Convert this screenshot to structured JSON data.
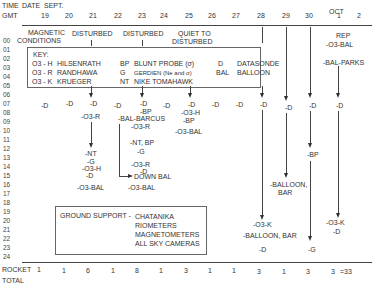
{
  "header": {
    "time_label": "TIME",
    "date_label": "DATE",
    "month_sept": "SEPT.",
    "gmt_label": "GMT",
    "month_oct": "OCT",
    "dates": [
      "19",
      "20",
      "21",
      "22",
      "23",
      "24",
      "25",
      "26",
      "27",
      "28",
      "29",
      "30",
      "1",
      "2"
    ]
  },
  "magnetic": {
    "label_line1": "MAGNETIC",
    "label_line2": "CONDITIONS",
    "disturbed1": "DISTURBED",
    "disturbed2": "DISTURBED",
    "quiet_line1": "QUIET TO",
    "quiet_line2": "DISTURBED"
  },
  "hours": [
    "00",
    "01",
    "02",
    "03",
    "04",
    "05",
    "06",
    "07",
    "08",
    "09",
    "10",
    "11",
    "12",
    "13",
    "14",
    "15",
    "16",
    "17",
    "18",
    "19",
    "20",
    "21",
    "22",
    "23",
    "24"
  ],
  "key": {
    "title": "KEY:",
    "rows": [
      {
        "code": "O3 - H",
        "name": "HILSENRATH",
        "code2": "BP",
        "name2": "BLUNT PROBE (σ)",
        "code3": "D",
        "name3": "DATASONDE"
      },
      {
        "code": "O3 - R",
        "name": "RANDHAWA",
        "code2": "G",
        "name2": "GERDIEN (Ne and σ)",
        "code3": "BAL",
        "name3": "BALLOON"
      },
      {
        "code": "O3 - K",
        "name": "KRUEGER",
        "code2": "NT",
        "name2": "NIKE TOMAHAWK",
        "code3": "",
        "name3": ""
      }
    ]
  },
  "events": {
    "rep": "REP",
    "o3bal_oct1": "-O3-BAL",
    "bal_parks": "-BAL-PARKS",
    "d": "-D",
    "o3r_21": "-O3-R",
    "bp_23": "-BP",
    "bal_barcus": "-BAL-BARCUS",
    "o3r_23": "-O3-R",
    "nt_bp": "-NT, BP",
    "g_23": "-G",
    "o3r_23b": "-O3-R",
    "d_23b": "-D",
    "down_bal": "DOWN BAL",
    "o3bal_23": "-O3-BAL",
    "nt_21": "-NT",
    "g_21": "-G",
    "o3h_21": "-O3-H",
    "d_21b": "-D",
    "o3bal_21": "-O3-BAL",
    "o3h_25": "-O3-H",
    "bp_25": "-BP",
    "o3bal_25": "-O3-BAL",
    "bp_30": "-BP",
    "balloon_bar_29a": "-BALLOON,",
    "balloon_bar_29b": "BAR",
    "o3k_28": "-O3-K",
    "balloon_bar_28": "-BALLOON, BAR",
    "d_28b": "-D",
    "g_30": "-G",
    "o3k_oct1": "-O3-K",
    "d_oct1b": "-D"
  },
  "ground_support": {
    "label": "GROUND SUPPORT -",
    "items": [
      "CHATANIKA",
      "RIOMETERS",
      "MAGNETOMETERS",
      "ALL SKY CAMERAS"
    ]
  },
  "totals": {
    "label_line1": "ROCKET",
    "label_line2": "TOTAL",
    "values": [
      "1",
      "1",
      "6",
      "1",
      "8",
      "1",
      "3",
      "1",
      "1",
      "3",
      "1",
      "3",
      "3"
    ],
    "sum": "=33"
  }
}
